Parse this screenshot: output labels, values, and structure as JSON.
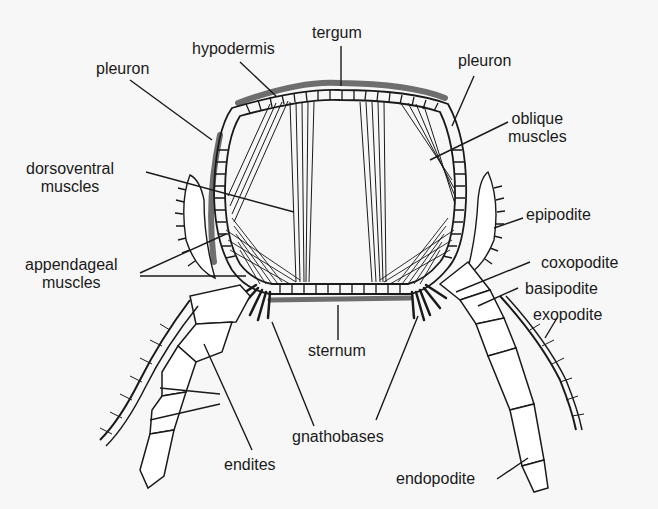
{
  "diagram": {
    "colors": {
      "background": "#f7f7f7",
      "ink": "#1a1a1a",
      "cuticle_shade": "#6e6e6e",
      "fill": "#ffffff"
    },
    "labels": {
      "tergum": "tergum",
      "hypodermis": "hypodermis",
      "pleuron_left": "pleuron",
      "pleuron_right": "pleuron",
      "oblique_muscles_1": "oblique",
      "oblique_muscles_2": "muscles",
      "dorsoventral_muscles_1": "dorsoventral",
      "dorsoventral_muscles_2": "muscles",
      "appendageal_muscles_1": "appendageal",
      "appendageal_muscles_2": "muscles",
      "epipodite": "epipodite",
      "coxopodite": "coxopodite",
      "basipodite": "basipodite",
      "exopodite": "exopodite",
      "sternum": "sternum",
      "gnathobases": "gnathobases",
      "endites": "endites",
      "endopodite": "endopodite"
    }
  }
}
